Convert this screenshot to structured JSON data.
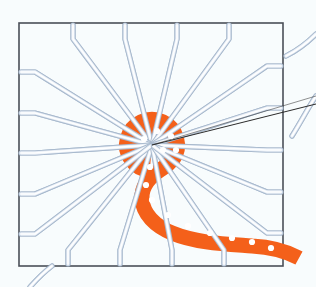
{
  "figure": {
    "title": "Fanout routing illustration",
    "type": "technical-line-drawing",
    "width": 316,
    "height": 287
  },
  "colors": {
    "background": "#f8fcfd",
    "outline": "#4a4f58",
    "trace_edge": "#a9bace",
    "trace_fill": "#e9eff7",
    "trace_highlight": "#ffffff",
    "net_orange": "#f4601a",
    "via_white": "#ffffff",
    "leader_line": "#2b2b2b"
  },
  "outline": {
    "name": "die-boundary",
    "shape": "square",
    "stroke_width": 1.6,
    "corners": {
      "top_left": [
        19,
        23
      ],
      "top_right": [
        283,
        23
      ],
      "bottom_right": [
        283,
        266
      ],
      "bottom_left": [
        19,
        266
      ]
    }
  },
  "edge_ticks": {
    "name": "pad-tick-marks",
    "length": 13,
    "top": [
      73,
      125,
      177,
      229
    ],
    "bottom": [
      68,
      120,
      172,
      224
    ],
    "left": [
      72,
      113,
      153,
      194,
      234
    ],
    "right": [
      66,
      108,
      150,
      192,
      233
    ]
  },
  "hub": {
    "name": "central-hub",
    "center": [
      152,
      145
    ],
    "outer_radius": 32,
    "inner_radius": 12,
    "label": "via hub"
  },
  "net_path": {
    "name": "highlighted-net",
    "color": "#f4601a",
    "stroke_width": 15,
    "exit_edge": "bottom-right",
    "via_count": 14,
    "vias": [
      [
        163,
        150
      ],
      [
        150,
        167
      ],
      [
        146,
        185
      ],
      [
        152,
        200
      ],
      [
        168,
        215
      ],
      [
        188,
        226
      ],
      [
        210,
        233
      ],
      [
        232,
        238
      ],
      [
        252,
        242
      ],
      [
        271,
        248
      ],
      [
        144,
        139
      ],
      [
        157,
        131
      ],
      [
        171,
        136
      ],
      [
        176,
        150
      ]
    ]
  },
  "traces": {
    "name": "fanout-traces",
    "count": 18,
    "style": "rounded-orthogonal-to-radial",
    "stroke_width": 5.2
  },
  "leader": {
    "name": "callout-leader-line",
    "from": [
      152,
      145
    ],
    "to": [
      316,
      104
    ]
  },
  "offcanvas_trace": {
    "name": "offcanvas-trace-top-right",
    "note": "pale blue trace curving off the top right corner"
  }
}
